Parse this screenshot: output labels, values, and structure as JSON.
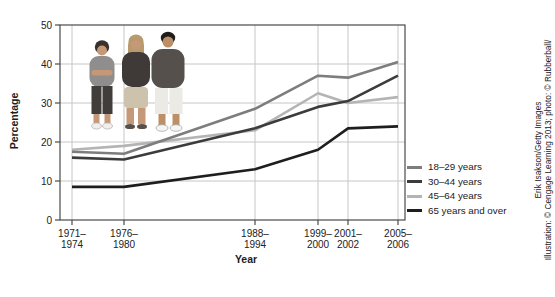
{
  "chart_data": {
    "type": "line",
    "title": "",
    "xlabel": "Year",
    "ylabel": "Percentage",
    "ylim": [
      0,
      50
    ],
    "y_ticks": [
      0,
      10,
      20,
      30,
      40,
      50
    ],
    "grid": true,
    "legend_position": "right",
    "categories": [
      "1971–1974",
      "1976–1980",
      "1988–1994",
      "1999–2000",
      "2001–2002",
      "2005–2006"
    ],
    "series": [
      {
        "name": "18–29 years",
        "color": "#7d7d7d",
        "values": [
          17.5,
          17.0,
          28.5,
          37.0,
          36.5,
          40.5
        ]
      },
      {
        "name": "30–44 years",
        "color": "#3c3c3c",
        "values": [
          16.0,
          15.5,
          23.5,
          29.0,
          30.5,
          37.0
        ]
      },
      {
        "name": "45–64 years",
        "color": "#b4b4b4",
        "values": [
          18.0,
          19.0,
          23.0,
          32.5,
          30.0,
          31.5
        ]
      },
      {
        "name": "65 years and over",
        "color": "#1e1e1e",
        "values": [
          8.5,
          8.5,
          13.0,
          18.0,
          23.5,
          24.0
        ]
      }
    ]
  },
  "credit": {
    "line1": "Illustration: © Cengage Learning 2013; photo: © Rubberball/",
    "line2": "Erik Isakson/Getty Images"
  }
}
